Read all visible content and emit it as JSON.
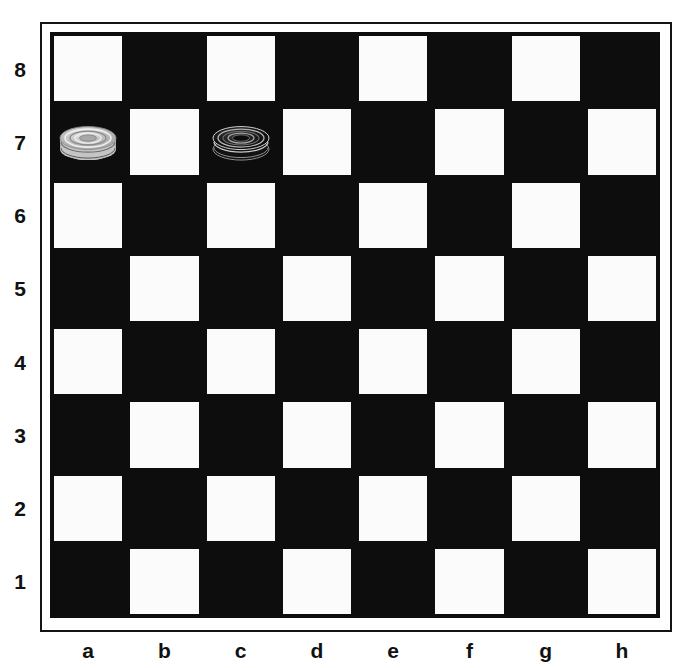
{
  "board": {
    "title": "Checkers board position",
    "size": 8,
    "files": [
      "a",
      "b",
      "c",
      "d",
      "e",
      "f",
      "g",
      "h"
    ],
    "ranks": [
      "8",
      "7",
      "6",
      "5",
      "4",
      "3",
      "2",
      "1"
    ],
    "colors": {
      "light_square": "#fbfbfb",
      "dark_square": "#0d0d0d",
      "frame_line": "#141414",
      "background": "#ffffff",
      "label_text": "#111111",
      "light_piece": "#c9c9c9",
      "dark_piece": "#101010"
    },
    "squares": [
      [
        "light",
        "dark",
        "light",
        "dark",
        "light",
        "dark",
        "light",
        "dark"
      ],
      [
        "dark",
        "light",
        "dark",
        "light",
        "dark",
        "light",
        "dark",
        "light"
      ],
      [
        "light",
        "dark",
        "light",
        "dark",
        "light",
        "dark",
        "light",
        "dark"
      ],
      [
        "dark",
        "light",
        "dark",
        "light",
        "dark",
        "light",
        "dark",
        "light"
      ],
      [
        "light",
        "dark",
        "light",
        "dark",
        "light",
        "dark",
        "light",
        "dark"
      ],
      [
        "dark",
        "light",
        "dark",
        "light",
        "dark",
        "light",
        "dark",
        "light"
      ],
      [
        "light",
        "dark",
        "light",
        "dark",
        "light",
        "dark",
        "light",
        "dark"
      ],
      [
        "dark",
        "light",
        "dark",
        "light",
        "dark",
        "light",
        "dark",
        "light"
      ]
    ],
    "pieces": [
      {
        "square": "a7",
        "file": "a",
        "rank": "7",
        "col": 0,
        "row": 1,
        "color": "light",
        "type": "king",
        "stack": 2,
        "label": "light-checker-a7"
      },
      {
        "square": "c7",
        "file": "c",
        "rank": "7",
        "col": 2,
        "row": 1,
        "color": "dark",
        "type": "king",
        "stack": 2,
        "label": "dark-checker-c7"
      }
    ]
  }
}
